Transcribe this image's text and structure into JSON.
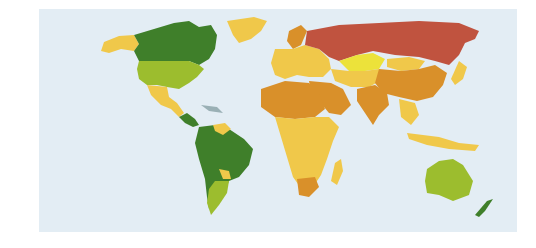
{
  "map": {
    "title": "",
    "projection": "world-robinson-like",
    "ocean_color": "#e3edf4",
    "categories": [
      {
        "key": "dark-green",
        "color": "#3f7f2a",
        "regions": [
          "Canada",
          "South America (most)",
          "New Zealand",
          "Central America (part)"
        ]
      },
      {
        "key": "light-green",
        "color": "#9cbd2e",
        "regions": [
          "United States",
          "Argentina",
          "Australia"
        ]
      },
      {
        "key": "yellow",
        "color": "#f0c84a",
        "regions": [
          "Alaska",
          "Greenland",
          "Mexico",
          "Europe",
          "Sub-Saharan Africa",
          "Southeast Asia",
          "Indonesia",
          "Madagascar"
        ]
      },
      {
        "key": "bright-yellow",
        "color": "#ece23a",
        "regions": [
          "Kazakhstan"
        ]
      },
      {
        "key": "orange",
        "color": "#d9902a",
        "regions": [
          "North Africa",
          "Middle East",
          "China",
          "India",
          "South Africa",
          "Scandinavia (part)"
        ]
      },
      {
        "key": "red",
        "color": "#c0533f",
        "regions": [
          "Russia"
        ]
      }
    ]
  }
}
